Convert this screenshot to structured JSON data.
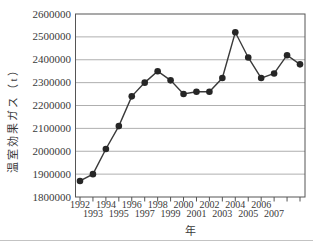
{
  "chart_data": {
    "type": "line",
    "title": "",
    "ylabel": "温室効果ガス（t）",
    "xlabel": "年",
    "x": [
      1992,
      1993,
      1994,
      1995,
      1996,
      1997,
      1998,
      1999,
      2000,
      2001,
      2002,
      2003,
      2004,
      2005,
      2006,
      2007,
      2008,
      2009
    ],
    "values": [
      1870000,
      1900000,
      2010000,
      2110000,
      2240000,
      2300000,
      2350000,
      2310000,
      2250000,
      2260000,
      2260000,
      2320000,
      2520000,
      2410000,
      2320000,
      2340000,
      2420000,
      2380000
    ],
    "ylim": [
      1800000,
      2600000
    ],
    "ytick_step": 100000,
    "ytick_labels": [
      "2600000",
      "2500000",
      "2400000",
      "2300000",
      "2200000",
      "2100000",
      "2000000",
      "1900000",
      "1800000"
    ],
    "xtick_years": [
      1992,
      1993,
      1994,
      1995,
      1996,
      1997,
      1998,
      1999,
      2000,
      2001,
      2002,
      2003,
      2004,
      2005,
      2006,
      2007,
      2008,
      2009
    ],
    "xtick_labels_top_row": [
      "1992",
      "1994",
      "1996",
      "1998",
      "2000",
      "2002",
      "2004",
      "2006"
    ],
    "xtick_labels_bottom_row": [
      "1993",
      "1995",
      "1997",
      "1999",
      "2001",
      "2003",
      "2005",
      "2007"
    ],
    "grid": "horizontal",
    "legend_position": "none",
    "marker": "filled-circle",
    "colors": {
      "line": "#3a3a3a",
      "marker": "#262626",
      "grid": "#9a9a9a",
      "frame": "#555555",
      "text": "#3a3a3a",
      "background": "#ffffff",
      "bottom_rule": "#c3c3c3"
    }
  }
}
